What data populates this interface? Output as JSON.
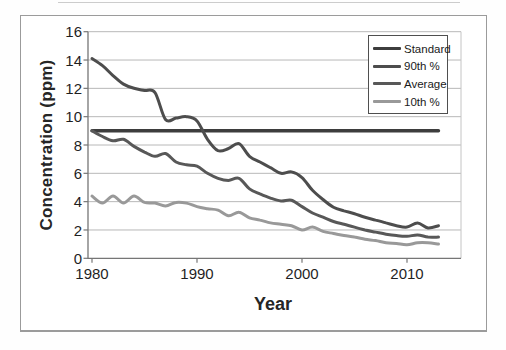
{
  "figure": {
    "y_axis_title": "Concentration (ppm)",
    "x_axis_title": "Year"
  },
  "colors": {
    "gridline": "#b8b8b8",
    "plot_right_border": "#c4c4c4",
    "axis_line": "#767676",
    "frame_border": "#9b9b9b",
    "legend_border": "#4f4f4f",
    "text": "#262626"
  },
  "chart_data": {
    "type": "line",
    "title": "",
    "xlabel": "Year",
    "ylabel": "Concentration (ppm)",
    "x": [
      1980,
      1981,
      1982,
      1983,
      1984,
      1985,
      1986,
      1987,
      1988,
      1989,
      1990,
      1991,
      1992,
      1993,
      1994,
      1995,
      1996,
      1997,
      1998,
      1999,
      2000,
      2001,
      2002,
      2003,
      2004,
      2005,
      2006,
      2007,
      2008,
      2009,
      2010,
      2011,
      2012,
      2013
    ],
    "series": [
      {
        "name": "Standard",
        "color": "#3d3d3d",
        "width": 3.4,
        "values": [
          9,
          9,
          9,
          9,
          9,
          9,
          9,
          9,
          9,
          9,
          9,
          9,
          9,
          9,
          9,
          9,
          9,
          9,
          9,
          9,
          9,
          9,
          9,
          9,
          9,
          9,
          9,
          9,
          9,
          9,
          9,
          9,
          9,
          9
        ]
      },
      {
        "name": "90th %",
        "color": "#4d4d4d",
        "width": 3,
        "values": [
          14.1,
          13.6,
          12.9,
          12.3,
          12.0,
          11.85,
          11.7,
          9.8,
          9.9,
          10.0,
          9.7,
          8.4,
          7.6,
          7.75,
          8.1,
          7.2,
          6.8,
          6.4,
          6.0,
          6.1,
          5.7,
          4.8,
          4.15,
          3.6,
          3.35,
          3.15,
          2.9,
          2.7,
          2.5,
          2.3,
          2.2,
          2.5,
          2.15,
          2.3
        ]
      },
      {
        "name": "Average",
        "color": "#585858",
        "width": 3,
        "values": [
          9.0,
          8.6,
          8.3,
          8.4,
          7.9,
          7.5,
          7.2,
          7.4,
          6.8,
          6.6,
          6.5,
          6.0,
          5.65,
          5.5,
          5.65,
          4.9,
          4.55,
          4.25,
          4.05,
          4.1,
          3.65,
          3.2,
          2.9,
          2.6,
          2.4,
          2.2,
          2.0,
          1.85,
          1.7,
          1.6,
          1.55,
          1.65,
          1.5,
          1.5
        ]
      },
      {
        "name": "10th %",
        "color": "#999999",
        "width": 3,
        "values": [
          4.4,
          3.9,
          4.4,
          3.9,
          4.4,
          3.95,
          3.9,
          3.7,
          3.95,
          3.9,
          3.65,
          3.5,
          3.4,
          3.0,
          3.25,
          2.85,
          2.7,
          2.5,
          2.4,
          2.3,
          2.0,
          2.2,
          1.9,
          1.75,
          1.6,
          1.5,
          1.35,
          1.25,
          1.1,
          1.05,
          0.95,
          1.1,
          1.1,
          1.0
        ]
      }
    ],
    "ylim": [
      0,
      16
    ],
    "y_tick_step": 2,
    "y_ticks": [
      16,
      14,
      12,
      10,
      8,
      6,
      4,
      2,
      0
    ],
    "x_ticks": [
      1980,
      1990,
      2000,
      2010
    ],
    "grid": true,
    "smoothed_lines": true,
    "legend_position": "top-right"
  }
}
